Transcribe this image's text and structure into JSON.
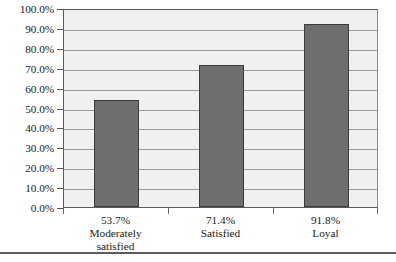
{
  "chart_data": {
    "type": "bar",
    "title": "",
    "subtitle": "",
    "xlabel": "",
    "ylabel": "",
    "categories": [
      "Moderately satisfied",
      "Satisfied",
      "Loyal"
    ],
    "category_lines": [
      [
        "Moderately",
        "satisfied"
      ],
      [
        "Satisfied"
      ],
      [
        "Loyal"
      ]
    ],
    "values": [
      53.7,
      71.4,
      91.8
    ],
    "value_labels": [
      "53.7%",
      "71.4%",
      "91.8%"
    ],
    "ylim": [
      0,
      100
    ],
    "ytick_step": 10,
    "ytick_labels": [
      "100.0%",
      "90.0%",
      "80.0%",
      "70.0%",
      "60.0%",
      "50.0%",
      "40.0%",
      "30.0%",
      "20.0%",
      "10.0%",
      "0.0%"
    ],
    "ytick_values": [
      100,
      90,
      80,
      70,
      60,
      50,
      40,
      30,
      20,
      10,
      0
    ],
    "grid": true,
    "grid_axis": "y",
    "legend": false,
    "legend_position": "none",
    "colors": {
      "bar_fill": "#6e6e6e",
      "bar_edge": "#3c3c3c",
      "plot_background": "#f0f0f0",
      "gridline": "#9a9a9a",
      "axis": "#5a5a5a",
      "page_background": "#ffffff",
      "text": "#1a1a1a",
      "bottom_rule": "#5c5c5c"
    }
  }
}
